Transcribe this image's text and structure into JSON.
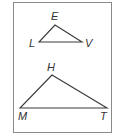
{
  "figure": {
    "border_color": "#8a8a8a",
    "line_color": "#3a3a3a",
    "triangles": [
      {
        "name": "small-triangle",
        "vertices": [
          {
            "label": "E",
            "x": 55,
            "y": 25
          },
          {
            "label": "L",
            "x": 39,
            "y": 42
          },
          {
            "label": "V",
            "x": 82,
            "y": 42
          }
        ]
      },
      {
        "name": "large-triangle",
        "vertices": [
          {
            "label": "H",
            "x": 52,
            "y": 75
          },
          {
            "label": "M",
            "x": 20,
            "y": 108
          },
          {
            "label": "T",
            "x": 107,
            "y": 108
          }
        ]
      }
    ],
    "labels": {
      "E": "E",
      "L": "L",
      "V": "V",
      "H": "H",
      "M": "M",
      "T": "T"
    }
  }
}
